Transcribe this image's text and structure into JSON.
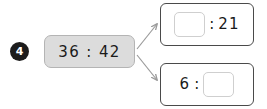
{
  "canvas": {
    "background": "#ffffff",
    "width": 267,
    "height": 109
  },
  "colors": {
    "badge_fill": "#1c1c1c",
    "badge_text": "#ffffff",
    "source_fill": "#dcdcdc",
    "source_border": "#b4b4b4",
    "target_border": "#4a4a4a",
    "blank_border": "#cfcfcf",
    "arrow": "#9a9a9a",
    "text": "#1a1a1a"
  },
  "step": {
    "number": "4"
  },
  "source": {
    "expression": "36 : 42",
    "minutes": "36",
    "separator": ":",
    "seconds": "42"
  },
  "targets": [
    {
      "id": "top",
      "blank_position": "left",
      "blank_value": "",
      "separator": ":",
      "known_value": "21",
      "expression": "___ : 21"
    },
    {
      "id": "bottom",
      "blank_position": "right",
      "known_value": "6",
      "separator": ":",
      "blank_value": "",
      "expression": "6 : ___"
    }
  ],
  "arrows": [
    {
      "id": "to-top",
      "from": "source-box",
      "to": "target-box-top"
    },
    {
      "id": "to-bottom",
      "from": "source-box",
      "to": "target-box-bottom"
    }
  ]
}
